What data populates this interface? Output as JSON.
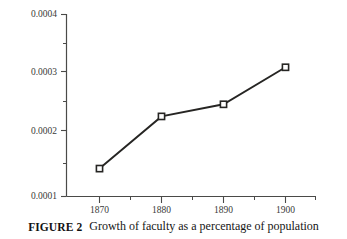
{
  "caption": {
    "label": "FIGURE 2",
    "text": "Growth of faculty as a percentage of population"
  },
  "colors": {
    "line": "#262523",
    "marker_fill": "#ffffff",
    "marker_stroke": "#262523",
    "axis": "#4a4a48",
    "text": "#161616",
    "background": "#ffffff"
  },
  "axis": {
    "y_tick_labels": [
      "0.0004",
      "0.0003",
      "0.0002",
      "0.0001"
    ],
    "x_tick_labels": [
      "1870",
      "1880",
      "1890",
      "1900"
    ]
  },
  "chart_data": {
    "type": "line",
    "title": "",
    "subtitle": "",
    "xlabel": "",
    "ylabel": "",
    "categories": [
      "1870",
      "1880",
      "1890",
      "1900"
    ],
    "x": [
      1870,
      1880,
      1890,
      1900
    ],
    "values": [
      0.000146,
      0.000232,
      0.000252,
      0.000313
    ],
    "series": [
      {
        "name": "Faculty as a percentage of population",
        "values": [
          0.000146,
          0.000232,
          0.000252,
          0.000313
        ]
      }
    ],
    "xlim": [
      1865,
      1905
    ],
    "ylim": [
      0.0001,
      0.0004
    ],
    "y_ticks": [
      0.0001,
      0.0002,
      0.0003,
      0.0004
    ],
    "y_minor_ticks": [
      0.00015,
      0.00025,
      0.00035
    ],
    "x_ticks": [
      1870,
      1880,
      1890,
      1900
    ],
    "x_minor_ticks": [
      1875,
      1885,
      1895
    ],
    "grid": false,
    "legend": "none",
    "marker": "open-square"
  }
}
